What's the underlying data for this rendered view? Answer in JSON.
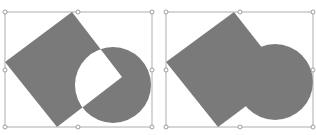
{
  "panels": [
    {
      "id": "left",
      "description": "Square and circle with exclusion (XOR) combine",
      "operation": "exclude",
      "fill": "#7a7a7a",
      "selection_box": {
        "x": 5,
        "y": 12,
        "w": 147,
        "h": 115
      },
      "square": [
        [
          72,
          12
        ],
        [
          5,
          62
        ],
        [
          57,
          127
        ],
        [
          122,
          77
        ]
      ],
      "circle": {
        "cx": 113,
        "cy": 85,
        "r": 38
      }
    },
    {
      "id": "right",
      "description": "Square and circle with union combine",
      "operation": "union",
      "fill": "#7a7a7a",
      "selection_box": {
        "x": 166,
        "y": 12,
        "w": 147,
        "h": 115
      },
      "square": [
        [
          234,
          12
        ],
        [
          166,
          62
        ],
        [
          218,
          127
        ],
        [
          285,
          77
        ]
      ],
      "circle": {
        "cx": 275,
        "cy": 82,
        "r": 38
      }
    }
  ],
  "colors": {
    "shape_fill": "#7a7a7a",
    "selection_stroke": "#9a9a9a",
    "handle_fill": "#ffffff"
  }
}
